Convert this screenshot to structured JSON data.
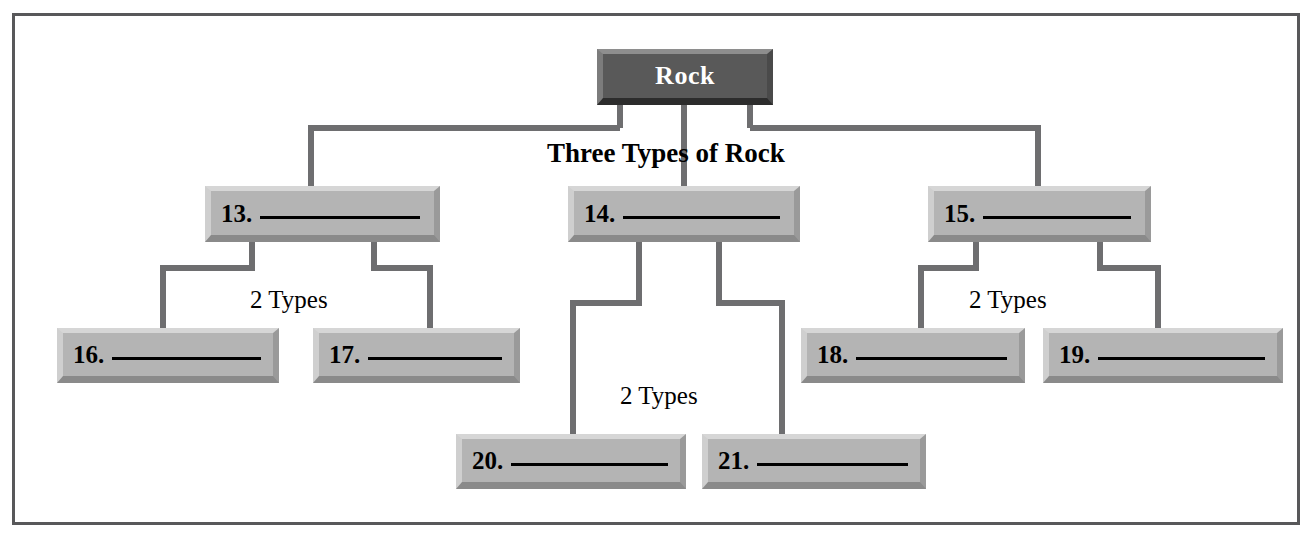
{
  "diagram": {
    "type": "hierarchy-tree-worksheet",
    "frame_color": "#58585a",
    "box_face_color": "#b4b4b4",
    "root_face_color": "#595959",
    "connector_color": "#6e6e70",
    "root": {
      "label": "Rock"
    },
    "captions": {
      "level1": "Three Types of Rock",
      "left_branch": "2 Types",
      "middle_branch": "2 Types",
      "right_branch": "2 Types"
    },
    "nodes": {
      "n13": {
        "number": "13.",
        "answer": ""
      },
      "n14": {
        "number": "14.",
        "answer": ""
      },
      "n15": {
        "number": "15.",
        "answer": ""
      },
      "n16": {
        "number": "16.",
        "answer": ""
      },
      "n17": {
        "number": "17.",
        "answer": ""
      },
      "n18": {
        "number": "18.",
        "answer": ""
      },
      "n19": {
        "number": "19.",
        "answer": ""
      },
      "n20": {
        "number": "20.",
        "answer": ""
      },
      "n21": {
        "number": "21.",
        "answer": ""
      }
    }
  }
}
